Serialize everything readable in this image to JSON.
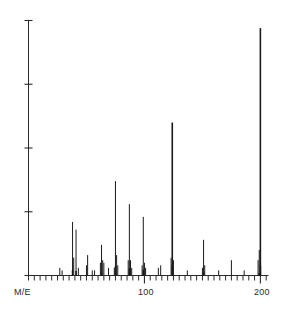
{
  "chart_data": {
    "type": "bar",
    "title": "",
    "subtitle": "",
    "xlabel": "M/E",
    "ylabel": "",
    "xlim": [
      0,
      207
    ],
    "ylim": [
      0,
      100
    ],
    "grid": false,
    "legend": null,
    "x_tick_labels": [
      "M/E",
      "100",
      "200"
    ],
    "x_tick_label_values": [
      0,
      100,
      200
    ],
    "x_minor_tick_interval": 5,
    "y_tick_count": 5,
    "y_tick_values": [
      0,
      25,
      50,
      75,
      100
    ],
    "y_tick_labels": [
      "",
      "",
      "",
      "",
      ""
    ],
    "categories": [
      27,
      29,
      39,
      41,
      43,
      50,
      51,
      55,
      57,
      63,
      65,
      69,
      74,
      75,
      76,
      77,
      89,
      91,
      98,
      101,
      102,
      115,
      128,
      139,
      141,
      152,
      165,
      178,
      181,
      198,
      199,
      200
    ],
    "values": [
      3,
      4,
      2,
      3,
      2,
      2,
      3,
      2,
      2,
      3,
      4,
      2,
      2,
      3,
      2,
      2,
      2,
      3,
      2,
      2,
      2,
      3,
      2,
      2,
      2,
      3,
      2,
      2,
      2,
      3,
      4,
      100
    ],
    "series": [
      {
        "name": "relative abundance",
        "peaks": [
          {
            "mz": 27,
            "intensity": 3
          },
          {
            "mz": 29,
            "intensity": 2
          },
          {
            "mz": 38,
            "intensity": 21
          },
          {
            "mz": 39,
            "intensity": 7
          },
          {
            "mz": 41,
            "intensity": 18
          },
          {
            "mz": 43,
            "intensity": 3
          },
          {
            "mz": 50,
            "intensity": 4
          },
          {
            "mz": 51,
            "intensity": 8
          },
          {
            "mz": 55,
            "intensity": 2
          },
          {
            "mz": 57,
            "intensity": 2
          },
          {
            "mz": 62,
            "intensity": 5
          },
          {
            "mz": 63,
            "intensity": 12
          },
          {
            "mz": 64,
            "intensity": 6
          },
          {
            "mz": 65,
            "intensity": 5
          },
          {
            "mz": 69,
            "intensity": 3
          },
          {
            "mz": 74,
            "intensity": 3
          },
          {
            "mz": 75,
            "intensity": 37
          },
          {
            "mz": 76,
            "intensity": 8
          },
          {
            "mz": 77,
            "intensity": 4
          },
          {
            "mz": 86,
            "intensity": 6
          },
          {
            "mz": 87,
            "intensity": 28
          },
          {
            "mz": 88,
            "intensity": 6
          },
          {
            "mz": 89,
            "intensity": 3
          },
          {
            "mz": 98,
            "intensity": 4
          },
          {
            "mz": 99,
            "intensity": 23
          },
          {
            "mz": 100,
            "intensity": 5
          },
          {
            "mz": 101,
            "intensity": 3
          },
          {
            "mz": 112,
            "intensity": 3
          },
          {
            "mz": 114,
            "intensity": 4
          },
          {
            "mz": 123,
            "intensity": 7
          },
          {
            "mz": 124,
            "intensity": 60
          },
          {
            "mz": 125,
            "intensity": 6
          },
          {
            "mz": 137,
            "intensity": 2
          },
          {
            "mz": 150,
            "intensity": 3
          },
          {
            "mz": 151,
            "intensity": 14
          },
          {
            "mz": 152,
            "intensity": 4
          },
          {
            "mz": 164,
            "intensity": 2
          },
          {
            "mz": 175,
            "intensity": 6
          },
          {
            "mz": 186,
            "intensity": 2
          },
          {
            "mz": 198,
            "intensity": 6
          },
          {
            "mz": 199,
            "intensity": 10
          },
          {
            "mz": 200,
            "intensity": 97
          }
        ]
      }
    ],
    "annotations": []
  }
}
